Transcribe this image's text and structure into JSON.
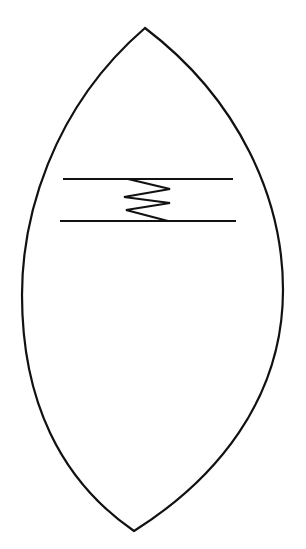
{
  "figure": {
    "cut_off_text": "partially visible text line cut off at top",
    "shape": "lens / vesica outline",
    "stroke_color": "#111111",
    "background": "#ffffff",
    "lens": {
      "top": [
        145,
        28
      ],
      "bottom": [
        134,
        531
      ],
      "left_x": 22,
      "right_x": 283
    },
    "bars": {
      "top_line": [
        [
          63,
          179
        ],
        [
          233,
          179
        ]
      ],
      "bottom_line": [
        [
          60,
          221
        ],
        [
          236,
          221
        ]
      ]
    },
    "zigzag": [
      [
        128,
        179
      ],
      [
        170,
        189
      ],
      [
        124,
        197
      ],
      [
        170,
        203
      ],
      [
        126,
        210
      ],
      [
        168,
        221
      ]
    ]
  }
}
